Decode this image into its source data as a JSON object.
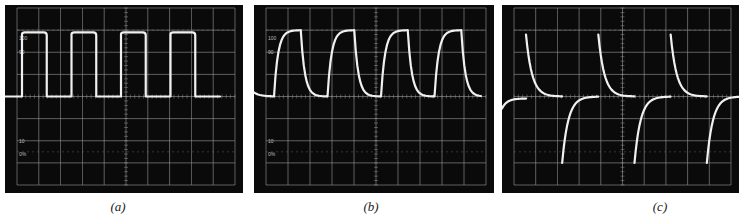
{
  "figure": {
    "panels": [
      {
        "id": "a",
        "caption": "a",
        "caption_text": "(a)",
        "x": 5,
        "width": 238,
        "height": 188,
        "labels": [
          "100",
          "90",
          "10",
          "0%"
        ],
        "waveform": "square"
      },
      {
        "id": "b",
        "caption": "b",
        "caption_text": "(b)",
        "x": 254,
        "width": 240,
        "height": 188,
        "labels": [
          "100",
          "90",
          "10",
          "0%"
        ],
        "waveform": "rc-integrated-square"
      },
      {
        "id": "c",
        "caption": "c",
        "caption_text": "(c)",
        "x": 502,
        "width": 237,
        "height": 188,
        "labels": [],
        "waveform": "rc-differentiated-square"
      }
    ]
  },
  "chart_data": [
    {
      "type": "line",
      "title": "(a)",
      "description": "Oscilloscope trace: square wave",
      "grid": {
        "x_divisions": 10,
        "y_divisions": 8,
        "on": true
      },
      "graticule_labels": [
        "100",
        "90",
        "10",
        "0%"
      ],
      "xlabel": "",
      "ylabel": "",
      "series": [
        {
          "name": "trace",
          "shape": "square",
          "periods_visible": 4,
          "high_div": 1.1,
          "low_div": 4.0,
          "duty": 0.5
        }
      ]
    },
    {
      "type": "line",
      "title": "(b)",
      "description": "Oscilloscope trace: square wave after RC low-pass (integrated) — exponential rise/fall",
      "grid": {
        "x_divisions": 10,
        "y_divisions": 8,
        "on": true
      },
      "graticule_labels": [
        "100",
        "90",
        "10",
        "0%"
      ],
      "xlabel": "",
      "ylabel": "",
      "series": [
        {
          "name": "trace",
          "shape": "exponential-charge-discharge",
          "periods_visible": 4,
          "high_div": 1.0,
          "low_div": 4.0
        }
      ]
    },
    {
      "type": "line",
      "title": "(c)",
      "description": "Oscilloscope trace: square wave after RC high-pass (differentiated) — exponential decay spikes",
      "grid": {
        "x_divisions": 10,
        "y_divisions": 8,
        "on": true
      },
      "graticule_labels": [],
      "xlabel": "",
      "ylabel": "",
      "series": [
        {
          "name": "trace",
          "shape": "exponential-decay-spikes",
          "periods_visible": 3,
          "spike_top_div": 1.2,
          "spike_bottom_div": 7.0,
          "baseline_div": 4.0
        }
      ]
    }
  ]
}
